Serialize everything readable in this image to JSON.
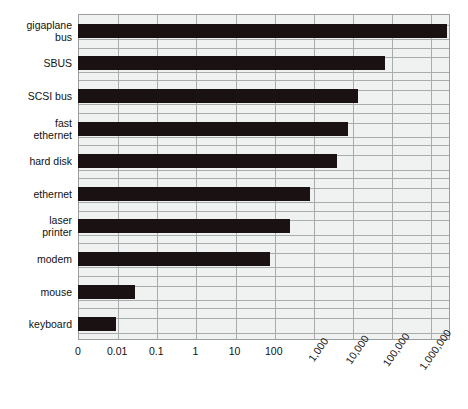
{
  "chart_data": {
    "type": "bar",
    "orientation": "horizontal",
    "title": "",
    "xlabel": "",
    "ylabel": "",
    "xscale": "log",
    "grid": true,
    "legend": null,
    "xtick_labels": [
      "0",
      "0.01",
      "0.1",
      "1",
      "10",
      "100",
      "1,000",
      "10,000",
      "100,000",
      "1,000,000"
    ],
    "xtick_rotated": [
      false,
      false,
      false,
      false,
      false,
      false,
      true,
      true,
      true,
      true
    ],
    "categories": [
      "gigaplane\nbus",
      "SBUS",
      "SCSI bus",
      "fast\nethernet",
      "hard disk",
      "ethernet",
      "laser\nprinter",
      "modem",
      "mouse",
      "keyboard"
    ],
    "values": [
      1000000,
      60000,
      13000,
      7000,
      4000,
      1000,
      400,
      150,
      0.1,
      0.01
    ],
    "bar_fractions": [
      0.992,
      0.826,
      0.752,
      0.726,
      0.696,
      0.624,
      0.57,
      0.516,
      0.153,
      0.102
    ],
    "colors": {
      "bar": "#1a1212",
      "plot_background": "#f0f2f2",
      "gridline": "#a8acac",
      "axis": "#9a9e9e",
      "text": "#111111",
      "page_background": "#ffffff"
    }
  }
}
